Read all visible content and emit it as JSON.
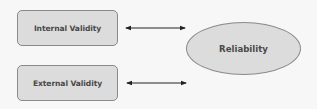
{
  "diagram": {
    "nodes": [
      {
        "id": "internal",
        "label": "Internal Validity",
        "shape": "rounded-rectangle"
      },
      {
        "id": "external",
        "label": "External Validity",
        "shape": "rounded-rectangle"
      },
      {
        "id": "reliability",
        "label": "Reliability",
        "shape": "ellipse"
      }
    ],
    "edges": [
      {
        "from": "internal",
        "to": "reliability",
        "type": "bidirectional-arrow"
      },
      {
        "from": "external",
        "to": "reliability",
        "type": "bidirectional-arrow"
      }
    ],
    "colors": {
      "node_fill": "#dcdcdc",
      "node_border": "#8a8a8a",
      "text": "#4a4a4a",
      "arrow": "#222222",
      "background": "#f7f7f7"
    }
  }
}
